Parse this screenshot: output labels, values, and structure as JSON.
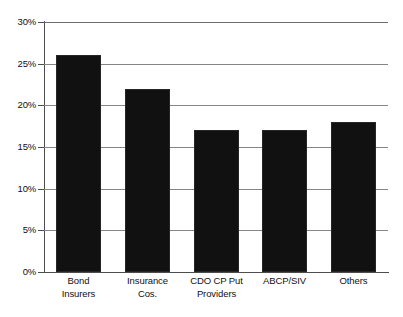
{
  "chart_data": {
    "type": "bar",
    "title": "",
    "subtitle": "",
    "xlabel": "",
    "ylabel": "",
    "categories": [
      "Bond Insurers",
      "Insurance Cos.",
      "CDO CP Put Providers",
      "ABCP/SIV",
      "Others"
    ],
    "category_lines": [
      [
        "Bond",
        "Insurers"
      ],
      [
        "Insurance",
        "Cos."
      ],
      [
        "CDO CP Put",
        "Providers"
      ],
      [
        "ABCP/SIV"
      ],
      [
        "Others"
      ]
    ],
    "values": [
      26,
      22,
      17,
      17,
      18
    ],
    "ylim": [
      0,
      30
    ],
    "ytick_values": [
      30,
      25,
      20,
      15,
      10,
      5,
      0
    ],
    "ytick_labels": [
      "30%",
      "25%",
      "20%",
      "15%",
      "10%",
      "5%",
      "0%"
    ],
    "grid": true,
    "legend": "none",
    "bar_color": "#111111",
    "grid_color": "#868686",
    "axis_color": "#4d4d4d",
    "background_color": "#ffffff"
  }
}
